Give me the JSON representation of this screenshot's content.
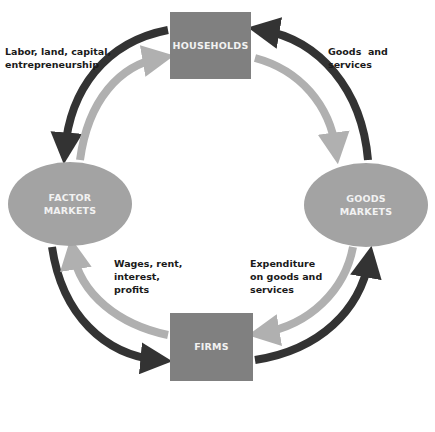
{
  "diagram": {
    "colors": {
      "box": "#808080",
      "ellipse": "#a3a3a3",
      "dark_arrow": "#333333",
      "light_arrow": "#b0b0b0",
      "node_text": "#f2f2f2",
      "label_text": "#1a1a1a"
    },
    "nodes": {
      "households": "HOUSEHOLDS",
      "firms": "FIRMS",
      "factor_markets": "FACTOR\nMARKETS",
      "goods_markets": "GOODS\nMARKETS"
    },
    "flows": {
      "labor_land": "Labor, land, capital,\nentrepreneurship",
      "goods_services": "Goods  and\nservices",
      "wages_rent": "Wages, rent,\ninterest,\nprofits",
      "expenditure": "Expenditure\non goods and\nservices"
    }
  }
}
